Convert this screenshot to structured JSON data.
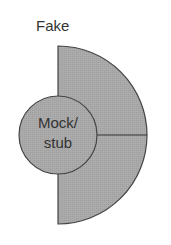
{
  "diagram": {
    "outer_label": "Fake",
    "inner_label_line1": "Mock/",
    "inner_label_line2": "stub",
    "colors": {
      "fill": "#a9a9a9",
      "stroke": "#444444",
      "text": "#333333",
      "background": "#ffffff"
    }
  }
}
